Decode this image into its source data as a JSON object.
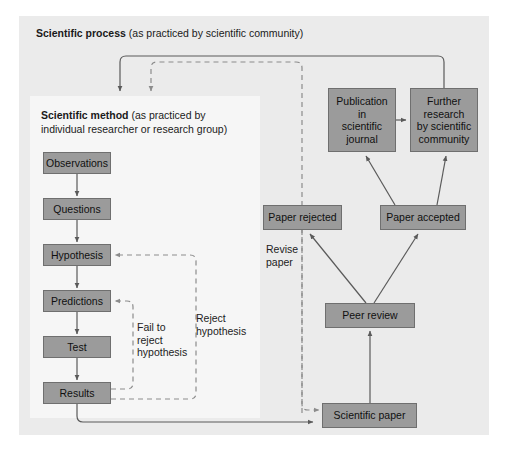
{
  "diagram": {
    "title_process_bold": "Scientific process",
    "title_process_rest": " (as practiced by scientific community)",
    "title_method_bold": "Scientific method",
    "title_method_rest": " (as practiced by",
    "title_method_line2": "individual researcher or research group)"
  },
  "colors": {
    "box_fill": "#9b9b9b",
    "box_stroke": "#6f6f6f",
    "outer_panel": "#ebebeb",
    "inner_panel": "#f6f6f6",
    "solid_arrow": "#5a5a5a",
    "dashed_arrow": "#8c8c8c",
    "text": "#101010"
  },
  "method_boxes": [
    {
      "id": "observations",
      "label": "Observations",
      "x": 43,
      "y": 152,
      "w": 68,
      "h": 22
    },
    {
      "id": "questions",
      "label": "Questions",
      "x": 43,
      "y": 198,
      "w": 68,
      "h": 22
    },
    {
      "id": "hypothesis",
      "label": "Hypothesis",
      "x": 43,
      "y": 244,
      "w": 68,
      "h": 22
    },
    {
      "id": "predictions",
      "label": "Predictions",
      "x": 43,
      "y": 290,
      "w": 68,
      "h": 22
    },
    {
      "id": "test",
      "label": "Test",
      "x": 43,
      "y": 336,
      "w": 68,
      "h": 22
    },
    {
      "id": "results",
      "label": "Results",
      "x": 43,
      "y": 382,
      "w": 68,
      "h": 22
    }
  ],
  "process_boxes": [
    {
      "id": "publication",
      "label": "Publication\nin\nscientific\njournal",
      "x": 328,
      "y": 88,
      "w": 68,
      "h": 64
    },
    {
      "id": "further-research",
      "label": "Further\nresearch\nby scientific\ncommunity",
      "x": 410,
      "y": 88,
      "w": 68,
      "h": 64
    },
    {
      "id": "paper-rejected",
      "label": "Paper rejected",
      "x": 263,
      "y": 205,
      "w": 79,
      "h": 25
    },
    {
      "id": "paper-accepted",
      "label": "Paper accepted",
      "x": 380,
      "y": 205,
      "w": 86,
      "h": 25
    },
    {
      "id": "peer-review",
      "label": "Peer review",
      "x": 325,
      "y": 303,
      "w": 90,
      "h": 25
    },
    {
      "id": "scientific-paper",
      "label": "Scientific paper",
      "x": 322,
      "y": 403,
      "w": 95,
      "h": 25
    }
  ],
  "edge_labels": [
    {
      "id": "fail-to-reject",
      "text": "Fail to\nreject\nhypothesis",
      "x": 137,
      "y": 321
    },
    {
      "id": "reject-hypothesis",
      "text": "Reject\nhypothesis",
      "x": 196,
      "y": 312
    },
    {
      "id": "revise-paper",
      "text": "Revise\npaper",
      "x": 266,
      "y": 243
    }
  ]
}
